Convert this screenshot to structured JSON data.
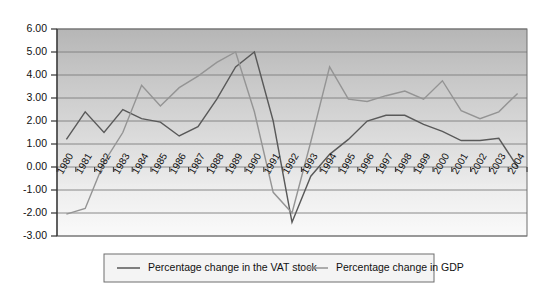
{
  "chart_data": {
    "type": "line",
    "title": "",
    "subtitle": "",
    "xlabel": "",
    "ylabel": "",
    "x": [
      "1980",
      "1981",
      "1982",
      "1983",
      "1984",
      "1985",
      "1986",
      "1987",
      "1988",
      "1989",
      "1990",
      "1991",
      "1992",
      "1993",
      "1994",
      "1995",
      "1996",
      "1997",
      "1998",
      "1999",
      "2000",
      "2001",
      "2002",
      "2003",
      "2004"
    ],
    "ylim": [
      -3.0,
      6.0
    ],
    "yticks": [
      "6.00",
      "5.00",
      "4.00",
      "3.00",
      "2.00",
      "1.00",
      "0.00",
      "-1.00",
      "-2.00",
      "-3.00"
    ],
    "ytick_values": [
      6.0,
      5.0,
      4.0,
      3.0,
      2.0,
      1.0,
      0.0,
      -1.0,
      -2.0,
      -3.0
    ],
    "grid": true,
    "legend_position": "bottom",
    "series": [
      {
        "name": "Percentage change in the VAT stock",
        "color": "#595959",
        "values": [
          1.2,
          2.4,
          1.5,
          2.5,
          2.1,
          1.95,
          1.35,
          1.75,
          2.95,
          4.35,
          5.0,
          2.0,
          -2.4,
          -0.4,
          0.55,
          1.2,
          2.0,
          2.25,
          2.25,
          1.85,
          1.55,
          1.15,
          1.15,
          1.25,
          0.0
        ]
      },
      {
        "name": "Percentage change in GDP",
        "color": "#949494",
        "values": [
          -2.05,
          -1.8,
          0.2,
          1.5,
          3.55,
          2.65,
          3.45,
          3.95,
          4.55,
          5.0,
          2.4,
          -1.1,
          -2.0,
          1.1,
          4.35,
          2.95,
          2.85,
          3.1,
          3.3,
          2.95,
          3.75,
          2.45,
          2.1,
          2.4,
          3.2
        ]
      }
    ]
  }
}
